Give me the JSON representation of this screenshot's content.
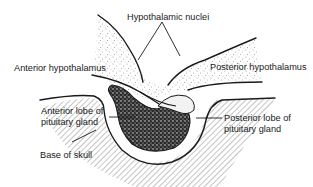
{
  "figure": {
    "labels": {
      "hypothalamic_nuclei": "Hypothalamic nuclei",
      "anterior_hypothalamus": "Anterior hypothalamus",
      "posterior_hypothalamus": "Posterior hypothalamus",
      "anterior_lobe_line1": "Anterior lobe of",
      "anterior_lobe_line2": "pituitary gland",
      "posterior_lobe_line1": "Posterior lobe of",
      "posterior_lobe_line2": "pituitary gland",
      "base_of_skull": "Base of skull"
    },
    "colors": {
      "ink": "#1a1a1a",
      "background": "#ffffff"
    }
  }
}
